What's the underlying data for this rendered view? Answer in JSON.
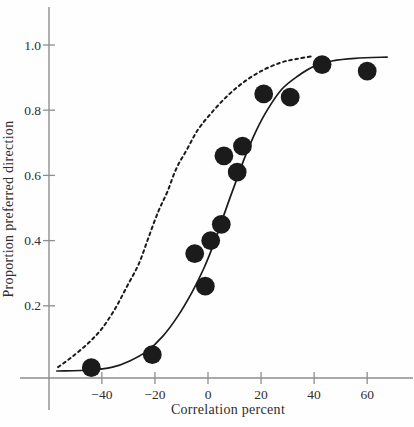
{
  "figure": {
    "paper_color": "#fefefe",
    "ink_color": "#1b1b1b",
    "axis_color": "#8e8e8e",
    "label_color": "#2e2e2e"
  },
  "chart_data": {
    "type": "scatter",
    "title": "",
    "xlabel": "Correlation percent",
    "ylabel": "Proportion preferred direction",
    "x_ticks": [
      -40,
      -20,
      0,
      20,
      40,
      60
    ],
    "x_tick_labels": [
      "−40",
      "−20",
      "0",
      "20",
      "40",
      "60"
    ],
    "y_ticks": [
      0.2,
      0.4,
      0.6,
      0.8,
      1.0
    ],
    "y_tick_labels": [
      "0.2",
      "0.4",
      "0.6",
      "0.8",
      "1.0"
    ],
    "xlim": [
      -60,
      77
    ],
    "ylim": [
      -0.04,
      1.12
    ],
    "grid": false,
    "legend": "none",
    "points": [
      [
        -44,
        0.01
      ],
      [
        -21,
        0.05
      ],
      [
        -5,
        0.36
      ],
      [
        -1,
        0.26
      ],
      [
        1,
        0.4
      ],
      [
        5,
        0.45
      ],
      [
        6,
        0.66
      ],
      [
        11,
        0.61
      ],
      [
        13,
        0.69
      ],
      [
        21,
        0.85
      ],
      [
        31,
        0.84
      ],
      [
        43,
        0.94
      ],
      [
        60,
        0.92
      ]
    ],
    "series": [
      {
        "name": "fitted-psychometric-function",
        "style": "solid",
        "samples": [
          [
            -57,
            0.0
          ],
          [
            -44.5,
            0.003
          ],
          [
            -36,
            0.012
          ],
          [
            -29.5,
            0.031
          ],
          [
            -23,
            0.061
          ],
          [
            -17,
            0.107
          ],
          [
            -11.3,
            0.169
          ],
          [
            -6,
            0.242
          ],
          [
            -1.5,
            0.316
          ],
          [
            2.6,
            0.399
          ],
          [
            6.4,
            0.488
          ],
          [
            10.2,
            0.574
          ],
          [
            13.9,
            0.656
          ],
          [
            18.1,
            0.736
          ],
          [
            22.6,
            0.804
          ],
          [
            27.9,
            0.865
          ],
          [
            33.9,
            0.905
          ],
          [
            40.3,
            0.936
          ],
          [
            46.7,
            0.951
          ],
          [
            55.4,
            0.959
          ],
          [
            67.5,
            0.963
          ]
        ]
      },
      {
        "name": "reference-psychometric-function",
        "style": "dashed",
        "samples": [
          [
            -56.5,
            0.012
          ],
          [
            -51.3,
            0.043
          ],
          [
            -45.2,
            0.085
          ],
          [
            -40,
            0.13
          ],
          [
            -35.1,
            0.19
          ],
          [
            -30.5,
            0.26
          ],
          [
            -26,
            0.33
          ],
          [
            -22.4,
            0.41
          ],
          [
            -18.7,
            0.49
          ],
          [
            -15.3,
            0.55
          ],
          [
            -12,
            0.62
          ],
          [
            -7.9,
            0.68
          ],
          [
            -3.8,
            0.74
          ],
          [
            1.1,
            0.79
          ],
          [
            6.8,
            0.84
          ],
          [
            12.8,
            0.882
          ],
          [
            19.6,
            0.918
          ],
          [
            27.1,
            0.945
          ],
          [
            33.2,
            0.957
          ],
          [
            39.2,
            0.965
          ]
        ]
      }
    ]
  }
}
